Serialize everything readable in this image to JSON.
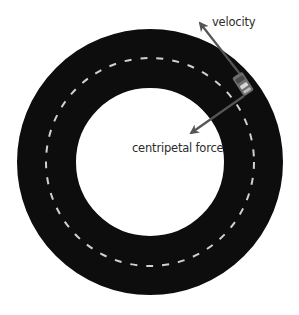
{
  "diagram": {
    "type": "circular-motion",
    "track": {
      "center": [
        150,
        162
      ],
      "outer_radius": 133,
      "inner_radius": 74,
      "lane_radius": 104,
      "track_color": "#0d0d0d",
      "lane_marking_color": "#d0d0d0",
      "background_color": "#ffffff"
    },
    "car": {
      "position": [
        243,
        84
      ],
      "color": "#777777"
    },
    "arrows": [
      {
        "name": "velocity",
        "from": [
          240,
          74
        ],
        "to": [
          199,
          22
        ],
        "color": "#555555"
      },
      {
        "name": "centripetal-force",
        "from": [
          244,
          96
        ],
        "to": [
          190,
          134
        ],
        "color": "#555555"
      }
    ],
    "labels": {
      "velocity": "velocity",
      "centripetal_force": "centripetal force"
    }
  }
}
